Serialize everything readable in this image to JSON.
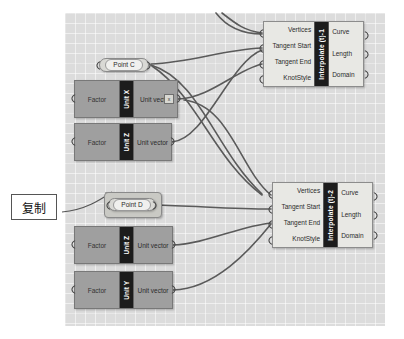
{
  "canvas": {
    "background_color": "#dcdcdc",
    "grid": "on"
  },
  "annotation": {
    "label": "复制",
    "arrow": "arrow-to-point-d"
  },
  "components": {
    "interpolate_1": {
      "title": "Interpolate (t)-1",
      "inputs": [
        "Vertices",
        "Tangent Start",
        "Tangent End",
        "KnotStyle"
      ],
      "outputs": [
        "Curve",
        "Length",
        "Domain"
      ]
    },
    "interpolate_2": {
      "title": "Interpolate (t)-2",
      "inputs": [
        "Vertices",
        "Tangent Start",
        "Tangent End",
        "KnotStyle"
      ],
      "outputs": [
        "Curve",
        "Length",
        "Domain"
      ]
    },
    "unit_x": {
      "title": "Unit X",
      "input": "Factor",
      "output": "Unit vector",
      "badge": "x"
    },
    "unit_z_upper": {
      "title": "Unit Z",
      "input": "Factor",
      "output": "Unit vector",
      "badge": ""
    },
    "unit_z_lower": {
      "title": "Unit Z",
      "input": "Factor",
      "output": "Unit vector",
      "badge": ""
    },
    "unit_y": {
      "title": "Unit Y",
      "input": "Factor",
      "output": "Unit vector",
      "badge": ""
    },
    "point_c": {
      "label": "Point C"
    },
    "point_d": {
      "label": "Point D",
      "state": "selected"
    }
  }
}
